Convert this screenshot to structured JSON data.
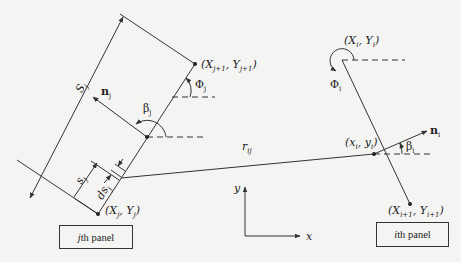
{
  "diagram": {
    "line_color": "#333333",
    "background": "#f4f4f2",
    "labels": {
      "S_j": "S",
      "S_j_sub": "j",
      "n_j": "n",
      "n_j_sub": "j",
      "beta_j": "β",
      "beta_j_sub": "j",
      "Phi_j": "Φ",
      "Phi_j_sub": "j",
      "Xj1": "(X",
      "Xj1_sub": "j+1",
      "Yj1_mid": ", Y",
      "Yj1_sub": "j+1",
      "Yj1_end": ")",
      "Xj": "(X",
      "Xj_sub": "j",
      "Yj_mid": ", Y",
      "Yj_sub": "j",
      "Yj_end": ")",
      "s_j": "s",
      "s_j_sub": "j",
      "ds_j": "ds",
      "ds_j_sub": "j",
      "r_ij": "r",
      "r_ij_sub": "ij",
      "Xi": "(X",
      "Xi_sub": "i",
      "Yi_mid": ", Y",
      "Yi_sub": "i",
      "Yi_end": ")",
      "Phi_i": "Φ",
      "Phi_i_sub": "i",
      "n_i": "n",
      "n_i_sub": "i",
      "beta_i": "β",
      "beta_i_sub": "i",
      "xi": "(x",
      "xi_sub": "i",
      "yi_mid": ", y",
      "yi_sub": "i",
      "yi_end": ")",
      "Xi1": "(X",
      "Xi1_sub": "i+1",
      "Yi1_mid": ", Y",
      "Yi1_sub": "i+1",
      "Yi1_end": ")",
      "axis_x": "x",
      "axis_y": "y"
    },
    "boxes": {
      "jth_panel_italic": "j",
      "jth_panel_text": "th panel",
      "ith_panel_italic": "i",
      "ith_panel_text": "th panel"
    }
  }
}
